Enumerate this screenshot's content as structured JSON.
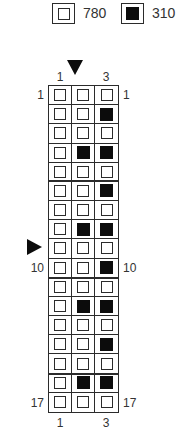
{
  "legend": {
    "items": [
      {
        "symbol": "white-square",
        "label": "780"
      },
      {
        "symbol": "black-square",
        "label": "310"
      }
    ]
  },
  "pattern": {
    "type": "bead-grid-chart",
    "columns": 3,
    "rows": 17,
    "cells": [
      "000",
      "001",
      "000",
      "011",
      "000",
      "001",
      "000",
      "011",
      "000",
      "001",
      "000",
      "011",
      "000",
      "001",
      "000",
      "011",
      "000"
    ],
    "legend_key": {
      "0": "780",
      "1": "310"
    },
    "row_labels": {
      "first": "1",
      "middle": "10",
      "last": "17"
    },
    "col_labels": {
      "first": "1",
      "last": "3"
    },
    "separators_after_rows": [
      5,
      10,
      15
    ],
    "markers": {
      "top_arrow": {
        "name": "center-column-marker",
        "column": 2
      },
      "left_arrow": {
        "name": "center-row-marker",
        "row": 9
      }
    }
  },
  "colors": {
    "line": "#2b2b2b",
    "text": "#333333",
    "bead_black": "#0c0c0c",
    "background": "#ffffff"
  }
}
